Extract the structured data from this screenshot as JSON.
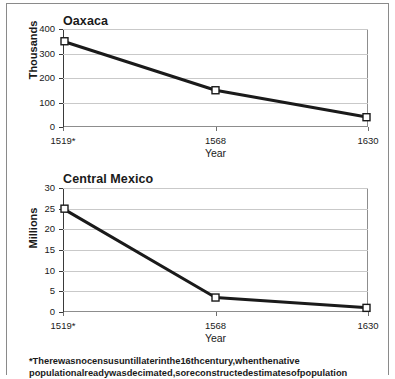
{
  "figure": {
    "footnote_line1": "*There was no census until later in the 16th century, when the native",
    "footnote_line2": "population already was decimated, so reconstructed estimates of population",
    "footnote_marker": "*"
  },
  "chart_data": [
    {
      "type": "line",
      "title": "Oaxaca",
      "xlabel": "Year",
      "ylabel": "Thousands",
      "categories": [
        "1519*",
        "1568",
        "1630"
      ],
      "values": [
        350,
        150,
        40
      ],
      "yticks": [
        0,
        100,
        200,
        300,
        400
      ],
      "ytick_labels": [
        "0",
        "100",
        "200",
        "300",
        "400"
      ],
      "ylim": [
        0,
        400
      ],
      "grid": true,
      "legend": "none",
      "marker": "open-square",
      "line_color": "#1a1a1a"
    },
    {
      "type": "line",
      "title": "Central Mexico",
      "xlabel": "Year",
      "ylabel": "Millions",
      "categories": [
        "1519*",
        "1568",
        "1630"
      ],
      "values": [
        25,
        3.5,
        1
      ],
      "yticks": [
        0,
        5,
        10,
        15,
        20,
        25,
        30
      ],
      "ytick_labels": [
        "0",
        "5",
        "10",
        "15",
        "20",
        "25",
        "30"
      ],
      "ylim": [
        0,
        30
      ],
      "grid": true,
      "legend": "none",
      "marker": "open-square",
      "line_color": "#1a1a1a"
    }
  ]
}
